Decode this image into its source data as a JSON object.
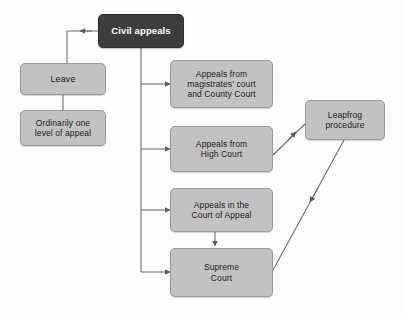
{
  "diagram": {
    "title": "Civil appeals",
    "type": "flowchart",
    "background_color": "#fdfdfd",
    "colors": {
      "root_fill": "#3d3d3d",
      "root_text": "#ffffff",
      "node_fill": "#c2c2c2",
      "node_border": "#9a9a9a",
      "node_text": "#1b1b1b",
      "edge": "#6e6e6e"
    },
    "nodes": [
      {
        "id": "civil-appeals",
        "label": "Civil appeals",
        "style": "dark",
        "x": 98,
        "y": 14,
        "width": 86,
        "height": 34,
        "font_size": 9.5,
        "font_weight": "bold"
      },
      {
        "id": "leave",
        "label": "Leave",
        "style": "light",
        "x": 20,
        "y": 63,
        "width": 86,
        "height": 32,
        "font_size": 9,
        "font_weight": "normal"
      },
      {
        "id": "ordinarily-one-level",
        "label": "Ordinarily one\nlevel of appeal",
        "style": "light",
        "x": 20,
        "y": 110,
        "width": 86,
        "height": 36,
        "font_size": 8.5,
        "font_weight": "normal"
      },
      {
        "id": "appeals-magistrates-county",
        "label": "Appeals from\nmagistrates' court\nand County Court",
        "style": "light",
        "x": 170,
        "y": 60,
        "width": 103,
        "height": 48,
        "font_size": 8.5,
        "font_weight": "normal"
      },
      {
        "id": "appeals-high-court",
        "label": "Appeals from\nHigh Court",
        "style": "light",
        "x": 170,
        "y": 126,
        "width": 103,
        "height": 46,
        "font_size": 8.5,
        "font_weight": "normal"
      },
      {
        "id": "appeals-court-of-appeal",
        "label": "Appeals in the\nCourt of Appeal",
        "style": "light",
        "x": 170,
        "y": 188,
        "width": 103,
        "height": 44,
        "font_size": 8.5,
        "font_weight": "normal"
      },
      {
        "id": "supreme-court",
        "label": "Supreme\nCourt",
        "style": "light",
        "x": 170,
        "y": 248,
        "width": 103,
        "height": 49,
        "font_size": 8.5,
        "font_weight": "normal"
      },
      {
        "id": "leapfrog-procedure",
        "label": "Leapfrog\nprocedure",
        "style": "light",
        "x": 305,
        "y": 100,
        "width": 80,
        "height": 40,
        "font_size": 8.5,
        "font_weight": "normal"
      }
    ],
    "edges": [
      {
        "from": "civil-appeals",
        "to": "leave",
        "kind": "elbow-left-down",
        "arrow": "left"
      },
      {
        "from": "leave",
        "to": "ordinarily-one-level",
        "kind": "straight-down",
        "arrow": "none"
      },
      {
        "from": "civil-appeals",
        "to": "appeals-magistrates-county",
        "kind": "trunk-branch-right",
        "arrow": "right"
      },
      {
        "from": "civil-appeals",
        "to": "appeals-high-court",
        "kind": "trunk-branch-right",
        "arrow": "right"
      },
      {
        "from": "civil-appeals",
        "to": "appeals-court-of-appeal",
        "kind": "trunk-branch-right",
        "arrow": "right"
      },
      {
        "from": "civil-appeals",
        "to": "supreme-court",
        "kind": "trunk-branch-right",
        "arrow": "right"
      },
      {
        "from": "appeals-court-of-appeal",
        "to": "supreme-court",
        "kind": "straight-down",
        "arrow": "down"
      },
      {
        "from": "appeals-high-court",
        "to": "leapfrog-procedure",
        "kind": "diagonal-up-right",
        "arrow": "up-right"
      },
      {
        "from": "leapfrog-procedure",
        "to": "supreme-court",
        "kind": "diagonal-down-left",
        "arrow": "down-left"
      }
    ]
  }
}
